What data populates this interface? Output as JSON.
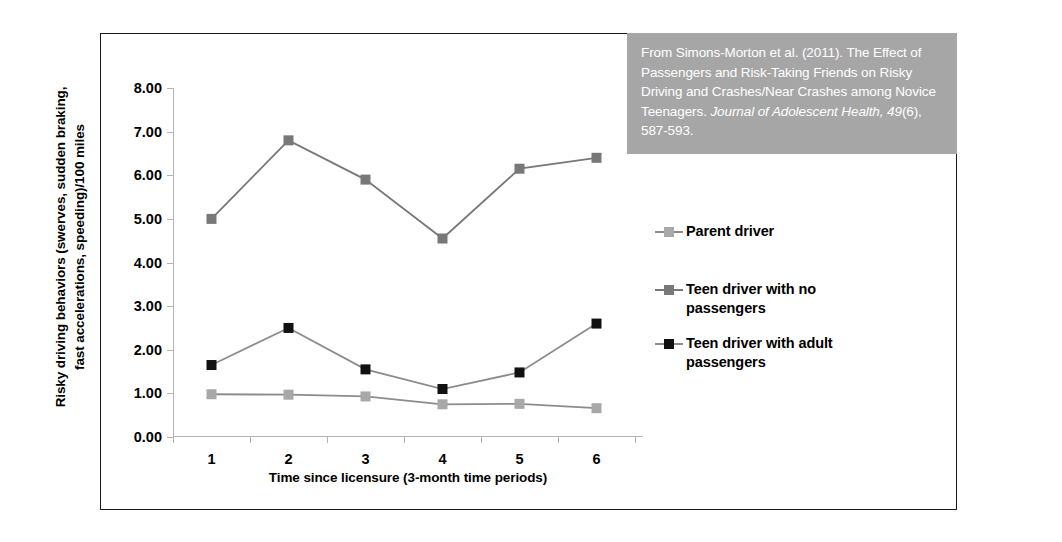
{
  "chart_data": {
    "type": "line",
    "title": "",
    "xlabel": "Time since licensure (3-month time periods)",
    "ylabel": "Risky driving behaviors (swerves, sudden braking, fast accelerations, speeding)/100 miles",
    "ylabel_line1": "Risky driving behaviors (swerves, sudden braking,",
    "ylabel_line2": "fast accelerations, speeding)/100 miles",
    "categories": [
      "1",
      "2",
      "3",
      "4",
      "5",
      "6"
    ],
    "ylim": [
      0,
      8
    ],
    "ytick_step": 1,
    "yticks": [
      "0.00",
      "1.00",
      "2.00",
      "3.00",
      "4.00",
      "5.00",
      "6.00",
      "7.00",
      "8.00"
    ],
    "ytick_values": [
      0,
      1,
      2,
      3,
      4,
      5,
      6,
      7,
      8
    ],
    "grid": false,
    "legend_position": "right",
    "series": [
      {
        "name": "Parent driver",
        "values": [
          0.98,
          0.97,
          0.93,
          0.75,
          0.76,
          0.66
        ],
        "color": "#a8a8a8",
        "marker_color": "#a8a8a8",
        "line_color": "#8c8c8c"
      },
      {
        "name": "Teen driver with no passengers",
        "values": [
          5.0,
          6.8,
          5.9,
          4.55,
          6.15,
          6.4
        ],
        "color": "#787878",
        "marker_color": "#787878",
        "line_color": "#787878"
      },
      {
        "name": "Teen driver with adult passengers",
        "values": [
          1.65,
          2.5,
          1.55,
          1.1,
          1.48,
          2.6
        ],
        "color": "#1a1a1a",
        "marker_color": "#111111",
        "line_color": "#8c8c8c"
      }
    ]
  },
  "legend": {
    "entries": [
      {
        "label_line1": "Parent driver",
        "label_line2": ""
      },
      {
        "label_line1": "Teen driver with no",
        "label_line2": "passengers"
      },
      {
        "label_line1": "Teen driver with adult",
        "label_line2": "passengers"
      }
    ]
  },
  "citation": {
    "part1": "From Simons-Morton et al. (2011). The Effect of Passengers and Risk-Taking Friends on Risky Driving and Crashes/Near Crashes among Novice Teenagers. ",
    "italic1": "Journal of Adolescent Health, 49",
    "part2": "(6), 587-593.",
    "background_color": "#a6a6a6",
    "text_color": "#ffffff"
  }
}
